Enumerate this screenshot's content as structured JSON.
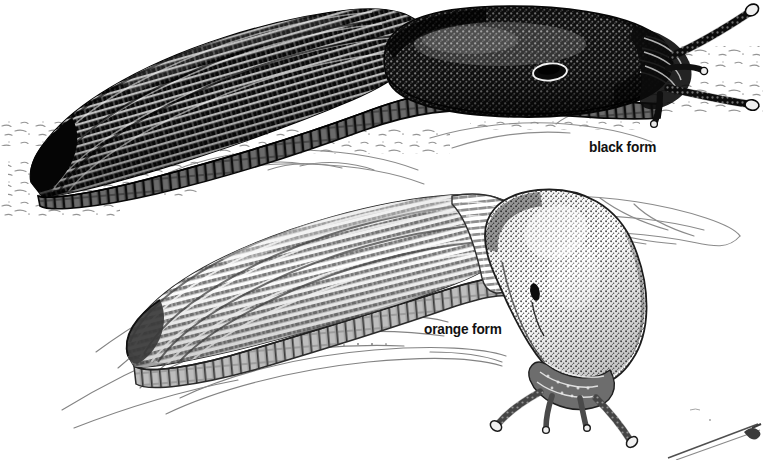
{
  "plate": {
    "title": "Slug colour forms illustration",
    "medium": "pen-and-ink scientific illustration",
    "background_color": "#ffffff",
    "width": 763,
    "height": 460
  },
  "labels": {
    "black_form": "black form",
    "orange_form": "orange form"
  },
  "specimens": [
    {
      "id": "black-form-slug",
      "label": "black form",
      "tone": "very dark / near black",
      "ink_color": "#0d0d0d",
      "body_hatch_color": "#151515",
      "mantle_stipple_color": "#1a1a1a",
      "foot_fringe_color": "#4a4a4a",
      "posture": "stretched out horizontally, head to the right",
      "parts": [
        "tail-tip",
        "keeled-body",
        "mantle-shield",
        "pneumostome",
        "foot-fringe",
        "upper-tentacle-pair",
        "lower-tentacle-pair"
      ]
    },
    {
      "id": "orange-form-slug",
      "label": "orange form",
      "tone": "mid grey",
      "ink_color": "#3c3c3c",
      "body_hatch_color": "#6a6a6a",
      "mantle_stipple_color": "#585858",
      "foot_fringe_color": "#8a8a8a",
      "posture": "head raised then curved downward to the right",
      "parts": [
        "tail-tip",
        "keeled-body",
        "mantle-shield",
        "pneumostome",
        "foot-fringe",
        "upper-tentacle-pair",
        "lower-tentacle-pair"
      ]
    }
  ],
  "background_elements": [
    {
      "name": "ground-speckle",
      "color": "#8d8d8d"
    },
    {
      "name": "leaf-upper",
      "color": "#8a8a8a"
    },
    {
      "name": "leaf-lower",
      "color": "#7f7f7f"
    },
    {
      "name": "leaf-right",
      "color": "#8a8a8a"
    },
    {
      "name": "cropped-illustration-edge",
      "color": "#555555"
    }
  ]
}
